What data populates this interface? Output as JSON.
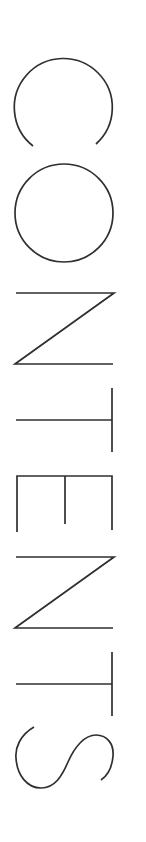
{
  "page": {
    "title": "CONTENTS",
    "orientation": "rotated-90-clockwise",
    "text_color": "#2f2f2f",
    "background_color": "#ffffff"
  },
  "letters": [
    "C",
    "O",
    "N",
    "T",
    "E",
    "N",
    "T",
    "S"
  ]
}
